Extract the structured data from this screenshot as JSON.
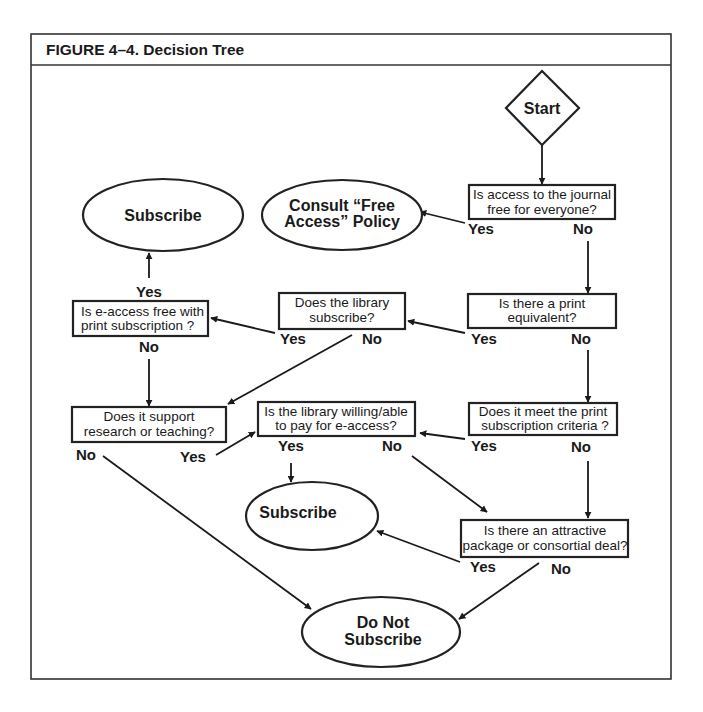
{
  "figure": {
    "title": "FIGURE 4–4. Decision Tree"
  },
  "nodes": {
    "start": {
      "label": "Start",
      "shape": "diamond"
    },
    "q_free_access": {
      "lines": [
        "Is access to the journal",
        "free for everyone?"
      ],
      "shape": "rectangle"
    },
    "consult_policy": {
      "lines": [
        "Consult “Free",
        "Access” Policy"
      ],
      "shape": "ellipse"
    },
    "subscribe_top": {
      "label": "Subscribe",
      "shape": "ellipse"
    },
    "q_eaccess_free": {
      "lines": [
        "Is e-access free with",
        "print subscription ?"
      ],
      "shape": "rectangle"
    },
    "q_library_subscribes": {
      "lines": [
        "Does the library",
        "subscribe?"
      ],
      "shape": "rectangle"
    },
    "q_print_equivalent": {
      "lines": [
        "Is there a print",
        "equivalent?"
      ],
      "shape": "rectangle"
    },
    "q_research_teaching": {
      "lines": [
        "Does it support",
        "research or teaching?"
      ],
      "shape": "rectangle"
    },
    "q_willing_pay": {
      "lines": [
        "Is the library willing/able",
        "to pay for e-access?"
      ],
      "shape": "rectangle"
    },
    "q_print_criteria": {
      "lines": [
        "Does it meet the print",
        "subscription criteria ?"
      ],
      "shape": "rectangle"
    },
    "subscribe_mid": {
      "label": "Subscribe",
      "shape": "ellipse"
    },
    "q_package_deal": {
      "lines": [
        "Is there an attractive",
        "package or consortial deal?"
      ],
      "shape": "rectangle"
    },
    "do_not_subscribe": {
      "lines": [
        "Do Not",
        "Subscribe"
      ],
      "shape": "ellipse"
    }
  },
  "edge_labels": {
    "free_access_yes": "Yes",
    "free_access_no": "No",
    "eaccess_free_yes": "Yes",
    "eaccess_free_no": "No",
    "library_subscribes_yes": "Yes",
    "library_subscribes_no": "No",
    "print_equivalent_yes": "Yes",
    "print_equivalent_no": "No",
    "research_teaching_no": "No",
    "research_teaching_yes": "Yes",
    "willing_pay_yes": "Yes",
    "willing_pay_no": "No",
    "print_criteria_yes": "Yes",
    "print_criteria_no": "No",
    "package_deal_yes": "Yes",
    "package_deal_no": "No"
  },
  "edges": [
    {
      "from": "start",
      "to": "q_free_access",
      "label": ""
    },
    {
      "from": "q_free_access",
      "to": "consult_policy",
      "label": "Yes"
    },
    {
      "from": "q_free_access",
      "to": "q_print_equivalent",
      "label": "No"
    },
    {
      "from": "q_print_equivalent",
      "to": "q_library_subscribes",
      "label": "Yes"
    },
    {
      "from": "q_print_equivalent",
      "to": "q_print_criteria",
      "label": "No"
    },
    {
      "from": "q_library_subscribes",
      "to": "q_eaccess_free",
      "label": "Yes"
    },
    {
      "from": "q_library_subscribes",
      "to": "q_research_teaching",
      "label": "No"
    },
    {
      "from": "q_eaccess_free",
      "to": "subscribe_top",
      "label": "Yes"
    },
    {
      "from": "q_eaccess_free",
      "to": "q_research_teaching",
      "label": "No"
    },
    {
      "from": "q_research_teaching",
      "to": "q_willing_pay",
      "label": "Yes"
    },
    {
      "from": "q_research_teaching",
      "to": "do_not_subscribe",
      "label": "No"
    },
    {
      "from": "q_print_criteria",
      "to": "q_willing_pay",
      "label": "Yes"
    },
    {
      "from": "q_print_criteria",
      "to": "q_package_deal",
      "label": "No"
    },
    {
      "from": "q_willing_pay",
      "to": "subscribe_mid",
      "label": "Yes"
    },
    {
      "from": "q_willing_pay",
      "to": "q_package_deal",
      "label": "No"
    },
    {
      "from": "q_package_deal",
      "to": "subscribe_mid",
      "label": "Yes"
    },
    {
      "from": "q_package_deal",
      "to": "do_not_subscribe",
      "label": "No"
    }
  ],
  "colors": {
    "stroke": "#222222",
    "text": "#1a1a1a",
    "background": "#ffffff"
  }
}
